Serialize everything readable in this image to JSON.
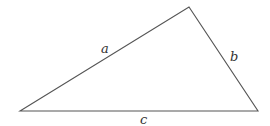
{
  "diagram": {
    "type": "triangle",
    "stroke_color": "#555555",
    "vertices": {
      "left": [
        20,
        111
      ],
      "top": [
        189,
        7
      ],
      "right": [
        258,
        111
      ]
    },
    "sides": [
      {
        "label": "a",
        "from": "left",
        "to": "top",
        "label_pos": [
          104,
          53
        ]
      },
      {
        "label": "b",
        "from": "top",
        "to": "right",
        "label_pos": [
          233,
          61
        ]
      },
      {
        "label": "c",
        "from": "left",
        "to": "right",
        "label_pos": [
          143,
          124
        ]
      }
    ]
  }
}
